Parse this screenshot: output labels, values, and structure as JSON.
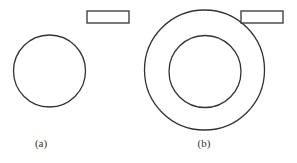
{
  "figure": {
    "panels": [
      {
        "label": "(a)",
        "description": "single circle with rectangle at upper right",
        "circles": [
          {
            "cx": 49.5,
            "cy": 71,
            "r": 36
          }
        ],
        "rectangle": {
          "x": 87,
          "y": 11,
          "width": 42,
          "height": 12
        }
      },
      {
        "label": "(b)",
        "description": "concentric circles (annulus) with rectangle at upper right",
        "circles": [
          {
            "cx": 204.5,
            "cy": 70,
            "r": 60
          },
          {
            "cx": 205,
            "cy": 71.5,
            "r": 36
          }
        ],
        "rectangle": {
          "x": 241,
          "y": 11,
          "width": 42,
          "height": 12
        }
      }
    ],
    "stroke_color": "#333333",
    "background": "#ffffff"
  }
}
